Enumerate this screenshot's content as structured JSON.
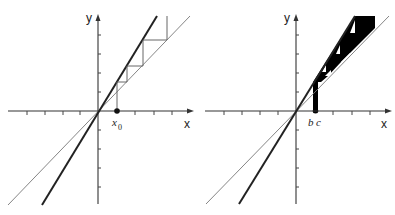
{
  "figure": {
    "left_panel": {
      "x_axis_label": "x",
      "y_axis_label": "y",
      "point_label": "x",
      "point_label_subscript": "0",
      "description": "Cobweb iteration starting at x0 between a steep line through origin and the identity line y = x"
    },
    "right_panel": {
      "x_axis_label": "x",
      "y_axis_label": "y",
      "interval_label_left": "b",
      "interval_label_right": "c",
      "description": "Iteration of an interval [b, c] producing a filled black staircase region between the two lines"
    },
    "colors": {
      "axis": "#333333",
      "thick_line": "#222222",
      "thin_line": "#777777",
      "staircase": "#666666",
      "fill": "#000000",
      "background": "#ffffff"
    }
  }
}
